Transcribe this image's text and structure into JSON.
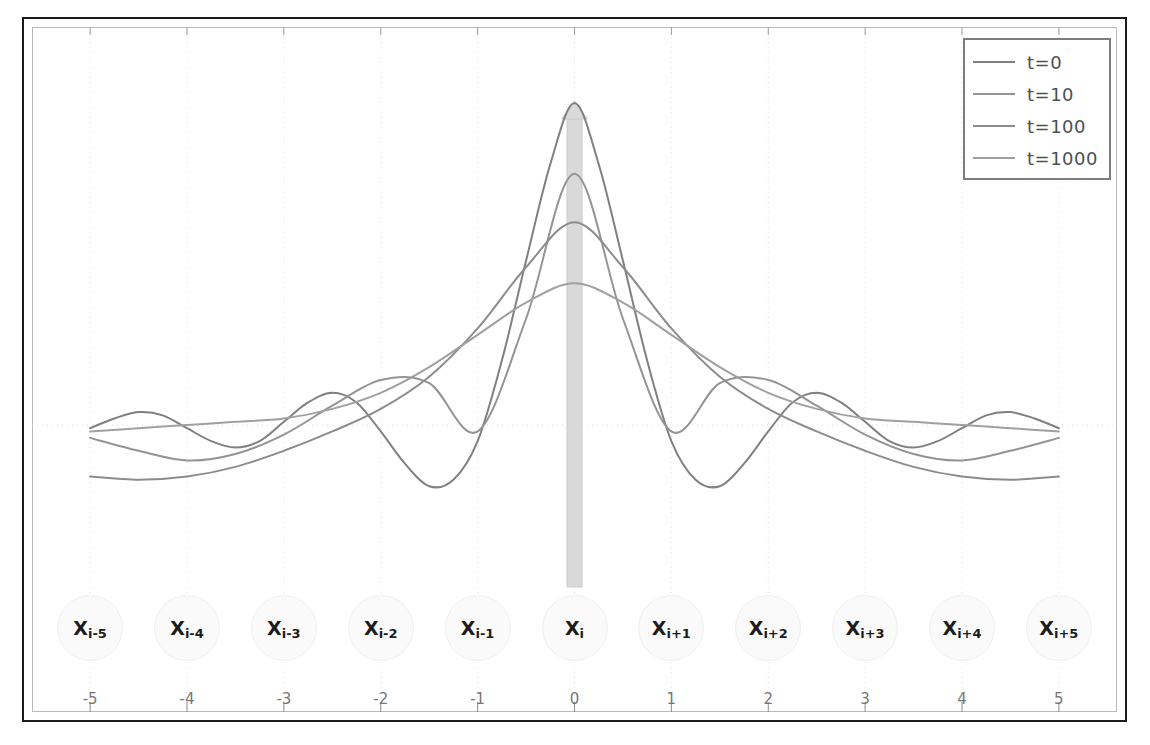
{
  "chart_data": {
    "type": "line",
    "title": "",
    "xlabel": "",
    "ylabel": "",
    "xlim": [
      -5.6,
      5.6
    ],
    "xticks": [
      "-5",
      "-4",
      "-3",
      "-2",
      "-1",
      "0",
      "1",
      "2",
      "3",
      "4",
      "5"
    ],
    "xtick_values": [
      -5,
      -4,
      -3,
      -2,
      -1,
      0,
      1,
      2,
      3,
      4,
      5
    ],
    "ylim": [
      -0.42,
      1.05
    ],
    "grid": "vertical dotted gridlines at each integer, horizontal dotted zero line",
    "zero_line": 0,
    "legend_position": "top-right",
    "series": [
      {
        "name": "t=0",
        "color": "#808080",
        "x": [
          -5,
          -4.75,
          -4.5,
          -4.25,
          -4,
          -3.75,
          -3.5,
          -3.25,
          -3,
          -2.75,
          -2.5,
          -2.25,
          -2,
          -1.75,
          -1.5,
          -1.25,
          -1,
          -0.75,
          -0.5,
          -0.25,
          0,
          0.25,
          0.5,
          0.75,
          1,
          1.25,
          1.5,
          1.75,
          2,
          2.25,
          2.5,
          2.75,
          3,
          3.25,
          3.5,
          3.75,
          4,
          4.25,
          4.5,
          4.75,
          5
        ],
        "y": [
          -0.01,
          0.02,
          0.04,
          0.03,
          -0.01,
          -0.05,
          -0.07,
          -0.05,
          0.01,
          0.07,
          0.1,
          0.07,
          -0.02,
          -0.12,
          -0.19,
          -0.17,
          -0.05,
          0.2,
          0.51,
          0.81,
          1.0,
          0.81,
          0.51,
          0.2,
          -0.05,
          -0.17,
          -0.19,
          -0.12,
          -0.02,
          0.07,
          0.1,
          0.07,
          0.01,
          -0.05,
          -0.07,
          -0.05,
          -0.01,
          0.03,
          0.04,
          0.02,
          -0.01
        ]
      },
      {
        "name": "t=10",
        "color": "#949494",
        "x": [
          -5,
          -4.5,
          -4,
          -3.5,
          -3,
          -2.5,
          -2,
          -1.5,
          -1,
          -0.5,
          0,
          0.5,
          1,
          1.5,
          2,
          2.5,
          3,
          3.5,
          4,
          4.5,
          5
        ],
        "y": [
          -0.04,
          -0.08,
          -0.11,
          -0.09,
          -0.03,
          0.06,
          0.14,
          0.13,
          -0.02,
          0.33,
          0.78,
          0.33,
          -0.02,
          0.13,
          0.14,
          0.06,
          -0.03,
          -0.09,
          -0.11,
          -0.08,
          -0.04
        ]
      },
      {
        "name": "t=100",
        "color": "#8c8c8c",
        "x": [
          -5,
          -4.5,
          -4,
          -3.5,
          -3,
          -2.5,
          -2,
          -1.5,
          -1,
          -0.5,
          0,
          0.5,
          1,
          1.5,
          2,
          2.5,
          3,
          3.5,
          4,
          4.5,
          5
        ],
        "y": [
          -0.16,
          -0.17,
          -0.16,
          -0.13,
          -0.08,
          -0.02,
          0.05,
          0.15,
          0.3,
          0.49,
          0.63,
          0.49,
          0.3,
          0.15,
          0.05,
          -0.02,
          -0.08,
          -0.13,
          -0.16,
          -0.17,
          -0.16
        ]
      },
      {
        "name": "t=1000",
        "color": "#a0a0a0",
        "x": [
          -5,
          -4.5,
          -4,
          -3.5,
          -3,
          -2.5,
          -2,
          -1.5,
          -1,
          -0.5,
          0,
          0.5,
          1,
          1.5,
          2,
          2.5,
          3,
          3.5,
          4,
          4.5,
          5
        ],
        "y": [
          -0.02,
          -0.01,
          0.0,
          0.01,
          0.02,
          0.05,
          0.1,
          0.18,
          0.28,
          0.38,
          0.44,
          0.38,
          0.28,
          0.18,
          0.1,
          0.05,
          0.02,
          0.01,
          0.0,
          -0.01,
          -0.02
        ]
      }
    ],
    "impulse_marker": {
      "shape": "upward arrow / vertical bar",
      "x": 0,
      "top_value": 1.0,
      "color": "#d9d9d9"
    }
  },
  "legend": {
    "entries": [
      {
        "label": "t=0",
        "color": "#808080"
      },
      {
        "label": "t=10",
        "color": "#949494"
      },
      {
        "label": "t=100",
        "color": "#8c8c8c"
      },
      {
        "label": "t=1000",
        "color": "#a0a0a0"
      }
    ]
  },
  "nodes": [
    {
      "base": "X",
      "sub": "i-5"
    },
    {
      "base": "X",
      "sub": "i-4"
    },
    {
      "base": "X",
      "sub": "i-3"
    },
    {
      "base": "X",
      "sub": "i-2"
    },
    {
      "base": "X",
      "sub": "i-1"
    },
    {
      "base": "X",
      "sub": "i"
    },
    {
      "base": "X",
      "sub": "i+1"
    },
    {
      "base": "X",
      "sub": "i+2"
    },
    {
      "base": "X",
      "sub": "i+3"
    },
    {
      "base": "X",
      "sub": "i+4"
    },
    {
      "base": "X",
      "sub": "i+5"
    }
  ],
  "axis": {
    "xticks": [
      "-5",
      "-4",
      "-3",
      "-2",
      "-1",
      "0",
      "1",
      "2",
      "3",
      "4",
      "5"
    ]
  },
  "colors": {
    "frame": "#1a1a1a",
    "plot_border": "#b9b9b9",
    "grid": "#dcdcdc",
    "node_fill": "#fafafa",
    "impulse": "#d9d9d9",
    "tick_text": "#777777"
  }
}
